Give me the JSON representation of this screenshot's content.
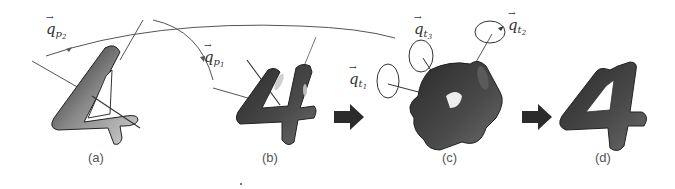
{
  "figure": {
    "panels": [
      {
        "id": "a",
        "label": "(a)",
        "description": "input 4-shaped object with two primary rotation axes"
      },
      {
        "id": "b",
        "label": "(b)",
        "description": "object rotated by primary rotations"
      },
      {
        "id": "c",
        "label": "(c)",
        "description": "object with three tertiary rotations applied"
      },
      {
        "id": "d",
        "label": "(d)",
        "description": "resulting recovered 4-shaped object"
      }
    ],
    "rotation_labels": {
      "qp2": {
        "base": "q",
        "sub": "p",
        "subsub": "2"
      },
      "qp1": {
        "base": "q",
        "sub": "p",
        "subsub": "1"
      },
      "qt1": {
        "base": "q",
        "sub": "t",
        "subsub": "1"
      },
      "qt2": {
        "base": "q",
        "sub": "t",
        "subsub": "2"
      },
      "qt3": {
        "base": "q",
        "sub": "t",
        "subsub": "3"
      }
    },
    "arrows": [
      "b-to-c",
      "c-to-d"
    ],
    "colors": {
      "shape": "#3a3a3a",
      "line": "#555555",
      "arrow": "#2b2b2b"
    }
  }
}
